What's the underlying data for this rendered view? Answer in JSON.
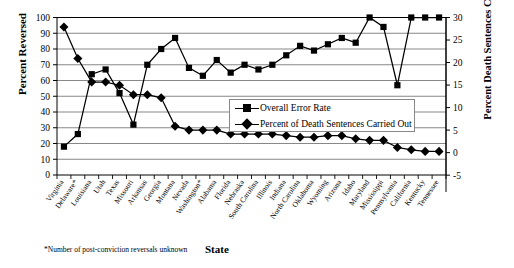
{
  "chart_data": {
    "type": "line",
    "title": "",
    "xlabel": "State",
    "ylabel": "Percent Reversed",
    "ylabel_right": "Percent Death Sentences Carried Out",
    "ylim": [
      0,
      100
    ],
    "ylim_right": [
      -5,
      30
    ],
    "ytick_step": 10,
    "ytick_step_right": 5,
    "yticks": [
      "100",
      "90",
      "80",
      "70",
      "60",
      "50",
      "40",
      "30",
      "20",
      "10",
      "0"
    ],
    "yticks_right": [
      "30",
      "25",
      "20",
      "15",
      "10",
      "5",
      "0",
      "-5"
    ],
    "grid": true,
    "legend_position": "center-right",
    "footnote": "*Number of post-conviction reversals unknown",
    "categories": [
      "Virginia",
      "Delaware*",
      "Louisiana",
      "Utah",
      "Texas",
      "Missouri",
      "Arkansas",
      "Georgia",
      "Montana",
      "Nevada",
      "Washington*",
      "Alabama",
      "Florida",
      "Nebraska",
      "South Carolina",
      "Illinois",
      "Indiana",
      "North Carolina",
      "Oklahoma",
      "Wyoming",
      "Arizona",
      "Idaho",
      "Maryland",
      "Mississippi",
      "Pennsylvania",
      "California",
      "Kentucky",
      "Tennessee"
    ],
    "series": [
      {
        "name": "Overall Error Rate",
        "axis": "left",
        "marker": "square",
        "values": [
          18,
          26,
          64,
          67,
          52,
          32,
          70,
          80,
          87,
          68,
          63,
          73,
          65,
          70,
          67,
          70,
          76,
          82,
          79,
          83,
          87,
          84,
          100,
          94,
          57,
          100,
          100,
          100
        ]
      },
      {
        "name": "Percent of Death Sentences Carried Out",
        "axis": "right",
        "marker": "diamond",
        "values": [
          28.2,
          22.0,
          17.7,
          17.7,
          17.0,
          15.2,
          15.0,
          14.6,
          9.3,
          8.5,
          8.5,
          8.5,
          7.6,
          7.6,
          7.6,
          7.6,
          7.3,
          7.0,
          7.0,
          7.3,
          7.3,
          6.7,
          6.4,
          6.4,
          5.1,
          4.6,
          4.3,
          4.3
        ]
      }
    ],
    "series_left_equivalent_for_diamond": [
      94,
      74,
      59,
      59,
      57,
      51,
      51,
      49,
      31,
      28.5,
      28.5,
      28.5,
      26,
      26,
      26,
      26,
      25,
      24,
      24,
      25,
      25,
      23,
      22,
      22,
      17.5,
      16,
      15,
      15
    ]
  },
  "legend": {
    "items": [
      {
        "label": "Overall Error Rate",
        "marker": "square"
      },
      {
        "label": "Percent of Death Sentences Carried Out",
        "marker": "diamond"
      }
    ]
  },
  "colors": {
    "series": "#000000",
    "grid": "#555555",
    "axis": "#000000",
    "background": "#ffffff"
  }
}
